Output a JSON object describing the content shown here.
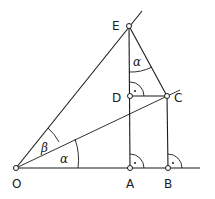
{
  "diagram": {
    "points": {
      "O": {
        "label": "O"
      },
      "A": {
        "label": "A"
      },
      "B": {
        "label": "B"
      },
      "C": {
        "label": "C"
      },
      "D": {
        "label": "D"
      },
      "E": {
        "label": "E"
      }
    },
    "angles": {
      "alpha_at_O": "α",
      "beta_at_O": "β",
      "alpha_at_E": "α"
    }
  }
}
